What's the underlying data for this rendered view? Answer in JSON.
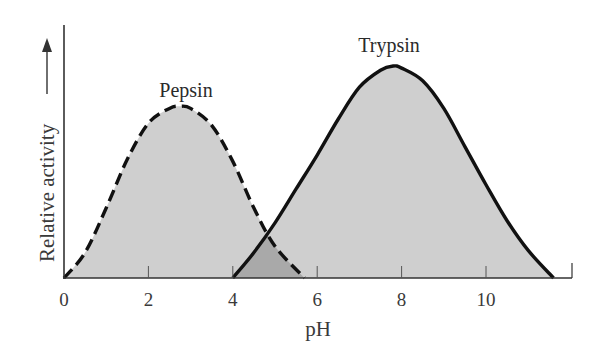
{
  "chart_data": {
    "type": "area",
    "title": "",
    "xlabel": "pH",
    "ylabel": "Relative activity",
    "ylabel_arrow": true,
    "xlim": [
      0,
      12
    ],
    "ylim": [
      0,
      1.1
    ],
    "x_ticks": [
      0,
      2,
      4,
      6,
      8,
      10
    ],
    "x_tick_labels": [
      "0",
      "2",
      "4",
      "6",
      "8",
      "10"
    ],
    "y_ticks": [],
    "grid": false,
    "legend": "none (curves labeled directly)",
    "series": [
      {
        "name": "Pepsin",
        "line_style": "dashed",
        "fill": "#cfcfcf",
        "start_ph": 0,
        "optimum_ph": 2.75,
        "end_ph": 5.7,
        "peak_relative": 0.8,
        "points": [
          [
            0,
            0
          ],
          [
            0.5,
            0.12
          ],
          [
            1,
            0.33
          ],
          [
            1.5,
            0.56
          ],
          [
            2,
            0.73
          ],
          [
            2.5,
            0.8
          ],
          [
            2.75,
            0.81
          ],
          [
            3,
            0.8
          ],
          [
            3.5,
            0.72
          ],
          [
            4,
            0.55
          ],
          [
            4.5,
            0.33
          ],
          [
            5,
            0.15
          ],
          [
            5.7,
            0
          ]
        ]
      },
      {
        "name": "Trypsin",
        "line_style": "solid",
        "fill": "#cfcfcf",
        "start_ph": 4,
        "optimum_ph": 7.8,
        "end_ph": 11.6,
        "peak_relative": 1.0,
        "points": [
          [
            4,
            0
          ],
          [
            4.5,
            0.12
          ],
          [
            5,
            0.26
          ],
          [
            5.5,
            0.42
          ],
          [
            6,
            0.58
          ],
          [
            6.5,
            0.75
          ],
          [
            7,
            0.9
          ],
          [
            7.5,
            0.98
          ],
          [
            7.8,
            1.0
          ],
          [
            8,
            0.99
          ],
          [
            8.5,
            0.93
          ],
          [
            9,
            0.8
          ],
          [
            9.5,
            0.62
          ],
          [
            10,
            0.44
          ],
          [
            10.5,
            0.27
          ],
          [
            11,
            0.13
          ],
          [
            11.6,
            0
          ]
        ]
      }
    ],
    "annotations": [
      {
        "text": "Pepsin",
        "near_ph": 2.9
      },
      {
        "text": "Trypsin",
        "near_ph": 7.9
      },
      {
        "text": "overlap region shaded darker",
        "ph_range": [
          4,
          5.7
        ]
      }
    ]
  },
  "labels": {
    "pepsin": "Pepsin",
    "trypsin": "Trypsin",
    "xlabel": "pH",
    "ylabel": "Relative activity"
  },
  "colors": {
    "fill": "#cfcfcf",
    "overlap_fill": "#a9a9a9",
    "line": "#111111",
    "axis": "#333333"
  }
}
